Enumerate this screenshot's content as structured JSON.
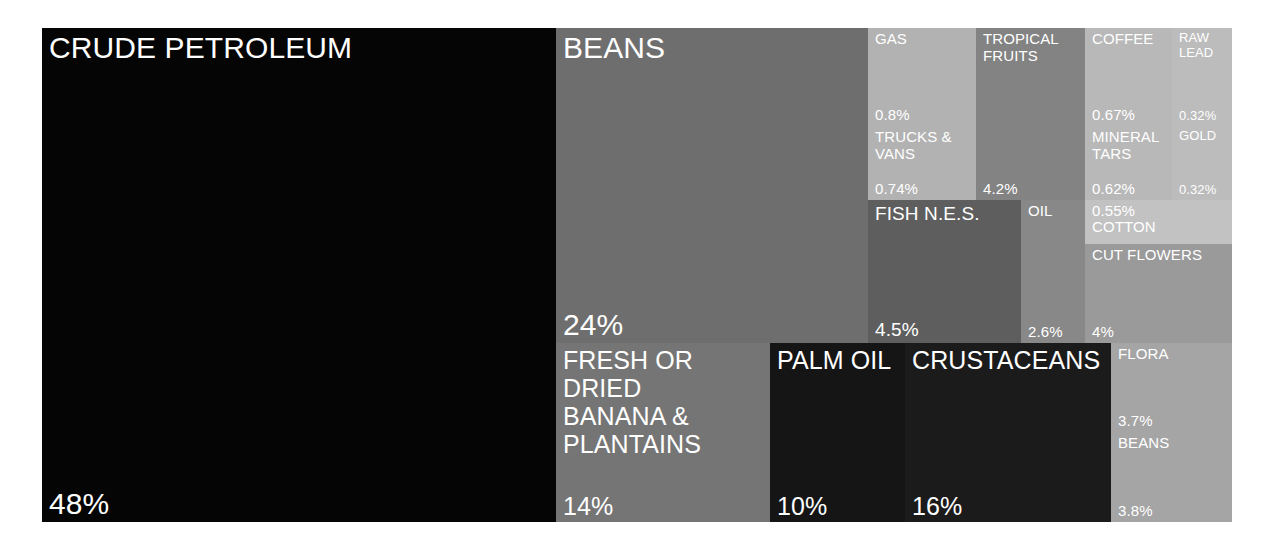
{
  "chart_data": {
    "type": "treemap",
    "title": "",
    "unit": "percent of total exports",
    "background": "#ffffff",
    "label_color": "#ffffff",
    "bounds": {
      "x": 42,
      "y": 28,
      "width": 1190,
      "height": 494
    },
    "tiles": [
      {
        "name": "CRUDE PETROLEUM",
        "value": "48%",
        "value_num": 48,
        "color": "#050505",
        "x": 0,
        "y": 0,
        "w": 514,
        "h": 494,
        "size": "s-xl"
      },
      {
        "name": "BEANS",
        "value": "24%",
        "value_num": 24,
        "color": "#6e6e6e",
        "x": 514,
        "y": 0,
        "w": 312,
        "h": 315,
        "size": "s-xl"
      },
      {
        "name": "GAS",
        "value": "0.8%",
        "value_num": 0.8,
        "color": "#b2b2b2",
        "x": 826,
        "y": 0,
        "w": 108,
        "h": 98,
        "size": "s-sm"
      },
      {
        "name": "TRUCKS &\nVANS",
        "value": "0.74%",
        "value_num": 0.74,
        "color": "#b2b2b2",
        "x": 826,
        "y": 98,
        "w": 108,
        "h": 74,
        "size": "s-sm"
      },
      {
        "name": "TROPICAL\nFRUITS",
        "value": "4.2%",
        "value_num": 4.2,
        "color": "#838383",
        "x": 934,
        "y": 0,
        "w": 109,
        "h": 172,
        "size": "s-sm"
      },
      {
        "name": "COFFEE",
        "value": "0.67%",
        "value_num": 0.67,
        "color": "#b8b8b8",
        "x": 1043,
        "y": 0,
        "w": 87,
        "h": 98,
        "size": "s-sm"
      },
      {
        "name": "MINERAL\nTARS",
        "value": "0.62%",
        "value_num": 0.62,
        "color": "#b8b8b8",
        "x": 1043,
        "y": 98,
        "w": 87,
        "h": 74,
        "size": "s-sm"
      },
      {
        "name": "RAW\nLEAD",
        "value": "0.32%",
        "value_num": 0.32,
        "color": "#bcbcbc",
        "x": 1130,
        "y": 0,
        "w": 60,
        "h": 98,
        "size": "s-xs"
      },
      {
        "name": "GOLD",
        "value": "0.32%",
        "value_num": 0.32,
        "color": "#bcbcbc",
        "x": 1130,
        "y": 98,
        "w": 60,
        "h": 74,
        "size": "s-xs"
      },
      {
        "name": "FISH N.E.S.",
        "value": "4.5%",
        "value_num": 4.5,
        "color": "#5e5e5e",
        "x": 826,
        "y": 172,
        "w": 153,
        "h": 143,
        "size": "s-md"
      },
      {
        "name": "OIL",
        "value": "2.6%",
        "value_num": 2.6,
        "color": "#888888",
        "x": 979,
        "y": 172,
        "w": 64,
        "h": 143,
        "size": "s-sm"
      },
      {
        "name": "COTTON",
        "value": "0.55%",
        "value_num": 0.55,
        "color": "#c2c2c2",
        "x": 1043,
        "y": 172,
        "w": 147,
        "h": 44,
        "size": "s-sm"
      },
      {
        "name": "CUT FLOWERS",
        "value": "4%",
        "value_num": 4,
        "color": "#9a9a9a",
        "x": 1043,
        "y": 216,
        "w": 147,
        "h": 99,
        "size": "s-sm"
      },
      {
        "name": "FRESH OR\nDRIED\nBANANA &\nPLANTAINS",
        "value": "14%",
        "value_num": 14,
        "color": "#757575",
        "x": 514,
        "y": 315,
        "w": 214,
        "h": 179,
        "size": "s-lg"
      },
      {
        "name": "PALM OIL",
        "value": "10%",
        "value_num": 10,
        "color": "#151515",
        "x": 728,
        "y": 315,
        "w": 135,
        "h": 179,
        "size": "s-lg"
      },
      {
        "name": "CRUSTACEANS",
        "value": "16%",
        "value_num": 16,
        "color": "#1b1b1b",
        "x": 863,
        "y": 315,
        "w": 206,
        "h": 179,
        "size": "s-lg"
      },
      {
        "name": "FLORA",
        "value": "3.7%",
        "value_num": 3.7,
        "color": "#a5a5a5",
        "x": 1069,
        "y": 315,
        "w": 121,
        "h": 89,
        "size": "s-sm"
      },
      {
        "name": "BEANS",
        "value": "3.8%",
        "value_num": 3.8,
        "color": "#a5a5a5",
        "x": 1069,
        "y": 404,
        "w": 121,
        "h": 90,
        "size": "s-sm"
      }
    ]
  }
}
